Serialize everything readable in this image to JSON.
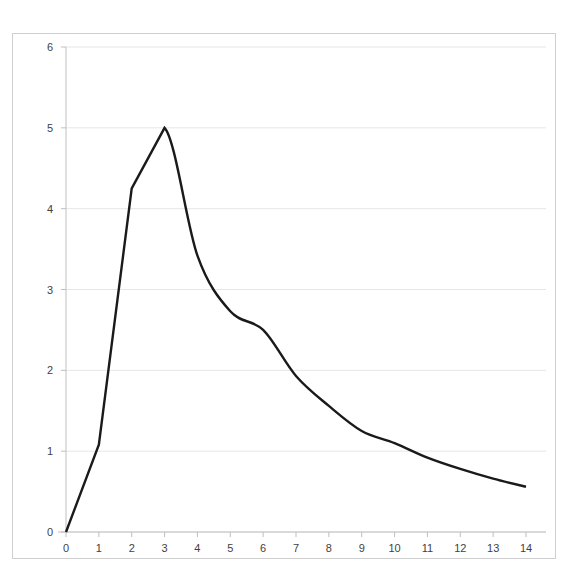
{
  "chart_data": {
    "type": "line",
    "title": "",
    "subtitle": "",
    "xlabel": "",
    "ylabel": "",
    "x": [
      0,
      1,
      2,
      3,
      4,
      5,
      6,
      7,
      8,
      9,
      10,
      11,
      12,
      13,
      14
    ],
    "values": [
      0,
      1.08,
      4.25,
      5.0,
      3.42,
      2.73,
      2.5,
      1.93,
      1.56,
      1.25,
      1.1,
      0.92,
      0.78,
      0.66,
      0.56
    ],
    "series": [
      {
        "name": "series-1",
        "values": [
          0,
          1.08,
          4.25,
          5.0,
          3.42,
          2.73,
          2.5,
          1.93,
          1.56,
          1.25,
          1.1,
          0.92,
          0.78,
          0.66,
          0.56
        ],
        "color": "#1a1a1a"
      }
    ],
    "xlim": [
      0,
      14
    ],
    "ylim": [
      0,
      6
    ],
    "xticks": [
      "0",
      "1",
      "2",
      "3",
      "4",
      "5",
      "6",
      "7",
      "8",
      "9",
      "10",
      "11",
      "12",
      "13",
      "14"
    ],
    "yticks": [
      "0",
      "1",
      "2",
      "3",
      "4",
      "5",
      "6"
    ],
    "grid": true,
    "grid_axis": "y",
    "legend": false,
    "legend_position": "none",
    "annotations": []
  },
  "style": {
    "line_color": "#1a1a1a",
    "grid_color": "#e6e6e6",
    "axis_color": "#bfbfbf",
    "tick_label_color": "#3f3f3f",
    "border_color": "#cfcfcf",
    "plot_background": "#ffffff",
    "page_background": "#ffffff"
  }
}
